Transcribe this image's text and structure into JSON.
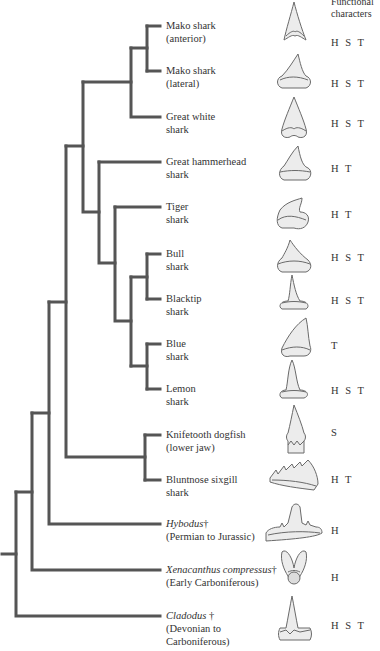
{
  "header": {
    "line1": "Functional",
    "line2": "characters"
  },
  "colors": {
    "branch": "#555555",
    "tooth_fill": "#e8e8e8",
    "tooth_stroke": "#666666",
    "text": "#333333"
  },
  "taxa": [
    {
      "name_line1": "Mako shark",
      "name_line2": "(anterior)",
      "italic": false,
      "extinct": false,
      "functions": "H S T",
      "y": 26
    },
    {
      "name_line1": "Mako shark",
      "name_line2": "(lateral)",
      "italic": false,
      "extinct": false,
      "functions": "H S T",
      "y": 71
    },
    {
      "name_line1": "Great white",
      "name_line2": "shark",
      "italic": false,
      "extinct": false,
      "functions": "H S T",
      "y": 117
    },
    {
      "name_line1": "Great hammerhead",
      "name_line2": "shark",
      "italic": false,
      "extinct": false,
      "functions": "H T",
      "y": 162
    },
    {
      "name_line1": "Tiger",
      "name_line2": "shark",
      "italic": false,
      "extinct": false,
      "functions": "H T",
      "y": 207
    },
    {
      "name_line1": "Bull",
      "name_line2": "shark",
      "italic": false,
      "extinct": false,
      "functions": "H S T",
      "y": 254
    },
    {
      "name_line1": "Blacktip",
      "name_line2": "shark",
      "italic": false,
      "extinct": false,
      "functions": "H S T",
      "y": 299
    },
    {
      "name_line1": "Blue",
      "name_line2": "shark",
      "italic": false,
      "extinct": false,
      "functions": "T",
      "y": 344
    },
    {
      "name_line1": "Lemon",
      "name_line2": "shark",
      "italic": false,
      "extinct": false,
      "functions": "H S T",
      "y": 389
    },
    {
      "name_line1": "Knifetooth dogfish",
      "name_line2": "(lower jaw)",
      "italic": false,
      "extinct": false,
      "functions": "S",
      "y": 435
    },
    {
      "name_line1": "Bluntnose sixgill",
      "name_line2": "shark",
      "italic": false,
      "extinct": false,
      "functions": "H T",
      "y": 480
    },
    {
      "name_line1": "Hybodus",
      "name_line1_suffix": "†",
      "name_line2": "(Permian to Jurassic)",
      "italic": true,
      "extinct": true,
      "functions": "H",
      "y": 524
    },
    {
      "name_line1": "Xenacanthus compressus",
      "name_line1_suffix": "†",
      "name_line2": "(Early Carboniferous)",
      "italic": true,
      "extinct": true,
      "functions": "H",
      "y": 570
    },
    {
      "name_line1": "Cladodus",
      "name_line1_suffix": " †",
      "name_line2": "(Devonian to",
      "name_line3": "Carboniferous)",
      "italic": true,
      "extinct": true,
      "functions": "H S T",
      "y": 616
    }
  ],
  "legend_codes": {
    "H": "holding",
    "S": "slicing",
    "T": "tearing"
  }
}
